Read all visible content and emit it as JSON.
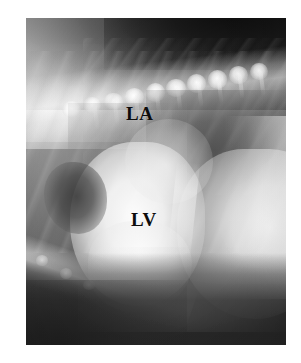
{
  "figure": {
    "kind": "radiograph",
    "modality": "x-ray",
    "view": "lateral thoracic",
    "canvas": {
      "width": 301,
      "height": 363,
      "background": "#ffffff"
    },
    "plate": {
      "left": 26,
      "top": 18,
      "width": 260,
      "height": 327
    }
  },
  "annotations": [
    {
      "id": "la",
      "text": "LA",
      "meaning": "left atrium",
      "color": "#0d0d0d",
      "x": 152,
      "y": 122
    },
    {
      "id": "lv",
      "text": "LV",
      "meaning": "left ventricle",
      "color": "#0d0d0d",
      "x": 158,
      "y": 228
    }
  ],
  "regions": {
    "top_air": "dark air band above patient, darkest upper-right",
    "dorsal_soft_tissue": "bright soft tissue of back and shoulder, upper-left",
    "spine": "thoracic vertebrae running diagonally upper-left to lower-right",
    "ribs": "diagonal rib striations through mid thorax",
    "lung_field": "darker aerated lung, caudodorsal",
    "gas_lucency": "dark gas-filled lucency left of heart",
    "heart": "bright cardiac silhouette, centre-left",
    "diaphragm_liver": "bright diaphragm and liver, right",
    "sternum": "bright diagonal sternal band, lower-left",
    "bottom_air": "dark band below patient"
  },
  "palette": {
    "page": "#ffffff",
    "film_dark": "#282828",
    "film_mid": "#8e8e8e",
    "film_bright": "#fafafa",
    "label": "#0d0d0d"
  }
}
